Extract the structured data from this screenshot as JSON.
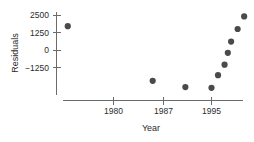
{
  "chart_data": {
    "type": "scatter",
    "title": "",
    "xlabel": "Year",
    "ylabel": "Residuals",
    "xlim": [
      1971,
      2002
    ],
    "ylim": [
      -3000,
      2700
    ],
    "grid": false,
    "legend": null,
    "xticks": [
      1980,
      1987,
      1995
    ],
    "xtick_labels": [
      "1980",
      "1987",
      "1995"
    ],
    "yticks": [
      -1250,
      0,
      1250,
      2500
    ],
    "ytick_labels": [
      "−1250",
      "0",
      "1250",
      "2500"
    ],
    "x": [
      1973,
      1986,
      1991,
      1995,
      1996,
      1997,
      1997.5,
      1998,
      1999,
      2000
    ],
    "y": [
      1700,
      -2200,
      -2650,
      -2700,
      -1800,
      -1050,
      -200,
      600,
      1500,
      2400
    ],
    "points": [
      {
        "x": 1973,
        "y": 1700
      },
      {
        "x": 1986,
        "y": -2200
      },
      {
        "x": 1991,
        "y": -2650
      },
      {
        "x": 1995,
        "y": -2700
      },
      {
        "x": 1996,
        "y": -1800
      },
      {
        "x": 1997,
        "y": -1050
      },
      {
        "x": 1997.5,
        "y": -200
      },
      {
        "x": 1998,
        "y": 600
      },
      {
        "x": 1999,
        "y": 1500
      },
      {
        "x": 2000,
        "y": 2400
      }
    ],
    "marker": {
      "shape": "circle",
      "color": "#4a4a4a",
      "size": 3.1
    },
    "axis_color": "#6b6b6b",
    "text_color": "#2b2b2b",
    "background": "#ffffff"
  },
  "axes": {
    "y_label": "Residuals",
    "x_label": "Year",
    "y_tick_labels": [
      "2500",
      "1250",
      "0",
      "−1250"
    ],
    "x_tick_labels": [
      "1980",
      "1987",
      "1995"
    ]
  }
}
